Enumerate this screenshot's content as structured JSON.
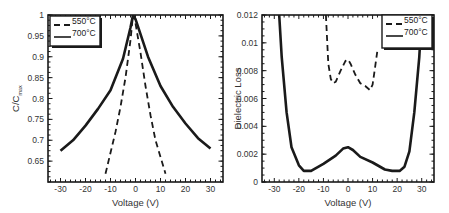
{
  "chart_data": [
    {
      "type": "line",
      "title": "",
      "xlabel": "Voltage (V)",
      "ylabel": "C/C_max",
      "ylabel_main": "C/C",
      "ylabel_sub": "max",
      "xlim": [
        -35,
        35
      ],
      "ylim": [
        0.6,
        1.0
      ],
      "xticks": [
        -30,
        -20,
        -10,
        0,
        10,
        20,
        30
      ],
      "xtick_labels": [
        "-30",
        "-20",
        "-10",
        "0",
        "10",
        "20",
        "30"
      ],
      "yticks": [
        0.65,
        0.7,
        0.75,
        0.8,
        0.85,
        0.9,
        0.95,
        1
      ],
      "ytick_labels": [
        "0.65",
        "0.7",
        "0.75",
        "0.8",
        "0.85",
        "0.9",
        "0.95",
        "1"
      ],
      "grid": false,
      "legend_position": "upper left",
      "series": [
        {
          "name": "550°C",
          "style": "dashed",
          "x": [
            -12,
            -10,
            -8,
            -6,
            -4,
            -2,
            -1,
            0,
            2,
            4,
            6,
            8,
            10,
            12
          ],
          "y": [
            0.62,
            0.67,
            0.72,
            0.78,
            0.85,
            0.94,
            1.0,
            0.98,
            0.91,
            0.83,
            0.76,
            0.7,
            0.66,
            0.62
          ]
        },
        {
          "name": "700°C",
          "style": "solid",
          "x": [
            -30,
            -25,
            -20,
            -15,
            -10,
            -5,
            -2,
            -1,
            0,
            5,
            10,
            15,
            20,
            25,
            30
          ],
          "y": [
            0.675,
            0.7,
            0.735,
            0.775,
            0.82,
            0.895,
            0.97,
            1.0,
            0.99,
            0.9,
            0.83,
            0.78,
            0.74,
            0.705,
            0.68
          ]
        }
      ]
    },
    {
      "type": "line",
      "title": "",
      "xlabel": "Voltage (V)",
      "ylabel": "Dielectric Loss",
      "xlim": [
        -35,
        35
      ],
      "ylim": [
        0,
        0.012
      ],
      "xticks": [
        -30,
        -20,
        -10,
        0,
        10,
        20,
        30
      ],
      "xtick_labels": [
        "-30",
        "-20",
        "-10",
        "0",
        "10",
        "20",
        "30"
      ],
      "yticks": [
        0,
        0.002,
        0.004,
        0.006,
        0.008,
        0.01,
        0.012
      ],
      "ytick_labels": [
        "0",
        "0.002",
        "0.004",
        "0.006",
        "0.008",
        "0.01",
        "0.012"
      ],
      "grid": false,
      "legend_position": "upper right",
      "series": [
        {
          "name": "550°C",
          "style": "dashed",
          "x": [
            -9,
            -8,
            -7,
            -6,
            -5,
            -3,
            -1,
            0,
            1,
            3,
            5,
            7,
            9,
            10,
            11,
            12
          ],
          "y": [
            0.012,
            0.0085,
            0.0074,
            0.0071,
            0.0072,
            0.008,
            0.0087,
            0.0088,
            0.0085,
            0.0077,
            0.0071,
            0.0069,
            0.0066,
            0.007,
            0.0082,
            0.0095
          ]
        },
        {
          "name": "700°C",
          "style": "solid",
          "x": [
            -28,
            -27,
            -25,
            -23,
            -20,
            -18,
            -15,
            -10,
            -5,
            -2,
            0,
            2,
            5,
            10,
            15,
            18,
            21,
            23,
            25,
            27,
            29,
            30
          ],
          "y": [
            0.012,
            0.009,
            0.005,
            0.0025,
            0.0012,
            0.0008,
            0.0008,
            0.0013,
            0.0019,
            0.0024,
            0.0025,
            0.0023,
            0.0018,
            0.0014,
            0.0009,
            0.0008,
            0.0008,
            0.0011,
            0.0022,
            0.005,
            0.009,
            0.012
          ]
        }
      ]
    }
  ]
}
